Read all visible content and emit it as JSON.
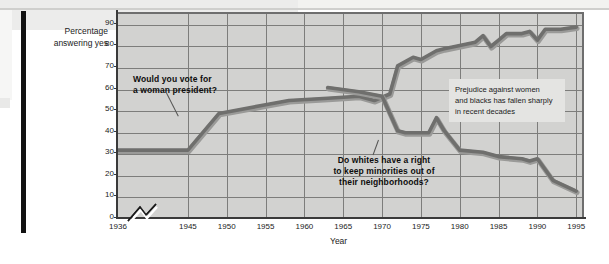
{
  "figure": {
    "y_axis_label_line1": "Percentage",
    "y_axis_label_line2": "answering yes",
    "x_axis_label": "Year"
  },
  "caption": {
    "line1": "Prejudice against women",
    "line2": "and blacks has fallen sharply",
    "line3": "in recent decades"
  },
  "annotations": {
    "woman_line1": "Would you vote for",
    "woman_line2": "a woman president?",
    "whites_line1": "Do whites have a right",
    "whites_line2": "to keep minorities out of",
    "whites_line3": "their neighborhoods?"
  },
  "colors": {
    "plot_background": "#d2d2d0",
    "gridline": "#7d7d7b",
    "axis": "#3a3a3a",
    "series": "#6f6f6d",
    "caption_background": "#e4e4e2",
    "text": "#1b1b1b",
    "gutter": "#121212"
  },
  "chart_data": {
    "type": "line",
    "title": "",
    "xlabel": "Year",
    "ylabel": "Percentage answering yes",
    "xlim": [
      1936,
      1996
    ],
    "ylim": [
      0,
      95
    ],
    "yticks": [
      0,
      10,
      20,
      30,
      40,
      50,
      60,
      70,
      80,
      90
    ],
    "xticks": [
      1936,
      1945,
      1950,
      1955,
      1960,
      1965,
      1970,
      1975,
      1980,
      1985,
      1990,
      1995
    ],
    "grid": true,
    "axis_break_x": true,
    "legend": "none",
    "series": [
      {
        "name": "Would you vote for a woman president?",
        "x": [
          1936,
          1945,
          1949,
          1955,
          1958,
          1963,
          1967,
          1969,
          1971,
          1972,
          1974,
          1975,
          1977,
          1978,
          1982,
          1983,
          1984,
          1985,
          1986,
          1988,
          1989,
          1990,
          1991,
          1993,
          1995
        ],
        "values": [
          31,
          31,
          48,
          52,
          54,
          55,
          56,
          54,
          57,
          70,
          74,
          73,
          77,
          78,
          81,
          84,
          79,
          82,
          85,
          85,
          86,
          82,
          87,
          87,
          88
        ]
      },
      {
        "name": "Do whites have a right to keep minorities out of their neighborhoods?",
        "x": [
          1963,
          1967,
          1970,
          1972,
          1973,
          1976,
          1977,
          1978,
          1980,
          1983,
          1985,
          1988,
          1989,
          1990,
          1992,
          1995
        ],
        "values": [
          60,
          58,
          56,
          40,
          39,
          39,
          46,
          40,
          31,
          30,
          28,
          27,
          26,
          27,
          17,
          12
        ]
      }
    ]
  }
}
